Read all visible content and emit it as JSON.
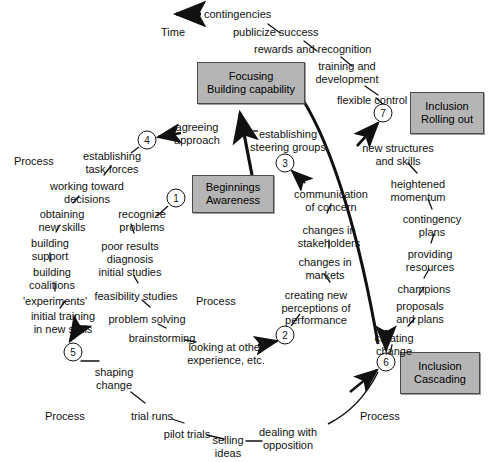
{
  "diagram": {
    "title_axis": {
      "time_label": "Time",
      "time_arrow_icon": "left-arrow-icon"
    },
    "boxes": [
      {
        "id": "focusing",
        "line1": "Focusing",
        "line2": "Building capability",
        "x": 197,
        "y": 62,
        "w": 106,
        "h": 40
      },
      {
        "id": "beginnings",
        "line1": "Beginnings",
        "line2": "Awareness",
        "x": 192,
        "y": 175,
        "w": 80,
        "h": 36
      },
      {
        "id": "rolling",
        "line1": "Inclusion",
        "line2": "Rolling out",
        "x": 410,
        "y": 92,
        "w": 72,
        "h": 40
      },
      {
        "id": "cascading",
        "line1": "Inclusion",
        "line2": "Cascading",
        "x": 400,
        "y": 352,
        "w": 78,
        "h": 40
      }
    ],
    "circles": [
      {
        "n": "1",
        "x": 176,
        "y": 198
      },
      {
        "n": "2",
        "x": 285,
        "y": 335
      },
      {
        "n": "3",
        "x": 285,
        "y": 163
      },
      {
        "n": "4",
        "x": 147,
        "y": 140
      },
      {
        "n": "5",
        "x": 73,
        "y": 352
      },
      {
        "n": "6",
        "x": 386,
        "y": 362
      },
      {
        "n": "7",
        "x": 383,
        "y": 113
      }
    ],
    "process_labels": [
      {
        "text": "Process",
        "x": 14,
        "y": 155
      },
      {
        "text": "Process",
        "x": 196,
        "y": 295
      },
      {
        "text": "Process",
        "x": 45,
        "y": 410
      },
      {
        "text": "Process",
        "x": 360,
        "y": 410
      }
    ],
    "labels": [
      {
        "id": "contingencies",
        "text": "contingencies",
        "x": 204,
        "y": 8,
        "align": "l"
      },
      {
        "id": "time",
        "text": "Time",
        "x": 161,
        "y": 26,
        "align": "l"
      },
      {
        "id": "publicize-success",
        "text": "publicize success",
        "x": 233,
        "y": 26,
        "align": "l"
      },
      {
        "id": "rewards-recognition",
        "text": "rewards and recognition",
        "x": 254,
        "y": 43,
        "align": "l"
      },
      {
        "id": "training-dev",
        "text": "training and\ndevelopment",
        "x": 347,
        "y": 60,
        "align": "c"
      },
      {
        "id": "flexible-control",
        "text": "flexible control",
        "x": 337,
        "y": 94,
        "align": "l"
      },
      {
        "id": "new-structures",
        "text": "new structures\nand skills",
        "x": 398,
        "y": 142,
        "align": "c"
      },
      {
        "id": "heightened-momentum",
        "text": "heightened\nmomentum",
        "x": 418,
        "y": 178,
        "align": "c"
      },
      {
        "id": "contingency-plans",
        "text": "contingency\nplans",
        "x": 432,
        "y": 213,
        "align": "c"
      },
      {
        "id": "providing-resources",
        "text": "providing\nresources",
        "x": 430,
        "y": 248,
        "align": "c"
      },
      {
        "id": "champions",
        "text": "champions",
        "x": 424,
        "y": 283,
        "align": "c"
      },
      {
        "id": "proposals-plans",
        "text": "proposals\nand plans",
        "x": 420,
        "y": 300,
        "align": "c"
      },
      {
        "id": "creating-change",
        "text": "creating\nchange",
        "x": 394,
        "y": 332,
        "align": "c"
      },
      {
        "id": "agreeing-approach",
        "text": "agreeing\napproach",
        "x": 197,
        "y": 121,
        "align": "c"
      },
      {
        "id": "establishing-steering",
        "text": "establishing\nsteering groups",
        "x": 288,
        "y": 128,
        "align": "c"
      },
      {
        "id": "establishing-task",
        "text": "establishing\ntask forces",
        "x": 112,
        "y": 150,
        "align": "c"
      },
      {
        "id": "working-toward",
        "text": "working toward\ndecisions",
        "x": 87,
        "y": 180,
        "align": "c"
      },
      {
        "id": "obtaining-new-skills",
        "text": "obtaining\nnew skills",
        "x": 62,
        "y": 208,
        "align": "c"
      },
      {
        "id": "building-support",
        "text": "building\nsupport",
        "x": 50,
        "y": 237,
        "align": "c"
      },
      {
        "id": "building-coalitions",
        "text": "building\ncoalitions",
        "x": 52,
        "y": 266,
        "align": "c"
      },
      {
        "id": "experiments",
        "text": "'experiments'",
        "x": 55,
        "y": 295,
        "align": "c"
      },
      {
        "id": "initial-training",
        "text": "initial training\nin new skills",
        "x": 63,
        "y": 310,
        "align": "c"
      },
      {
        "id": "recognize-problems",
        "text": "recognize\nproblems",
        "x": 142,
        "y": 208,
        "align": "c"
      },
      {
        "id": "poor-results",
        "text": "poor results",
        "x": 130,
        "y": 240,
        "align": "c"
      },
      {
        "id": "diagnosis",
        "text": "diagnosis",
        "x": 130,
        "y": 253,
        "align": "c"
      },
      {
        "id": "initial-studies",
        "text": "initial studies",
        "x": 130,
        "y": 266,
        "align": "c"
      },
      {
        "id": "feasibility-studies",
        "text": "feasibility studies",
        "x": 136,
        "y": 290,
        "align": "c"
      },
      {
        "id": "problem-solving",
        "text": "problem solving",
        "x": 147,
        "y": 313,
        "align": "c"
      },
      {
        "id": "brainstorming",
        "text": "brainstorming",
        "x": 162,
        "y": 332,
        "align": "c"
      },
      {
        "id": "looking-at-other",
        "text": "looking at other\nexperience, etc.",
        "x": 226,
        "y": 341,
        "align": "c"
      },
      {
        "id": "communication-concern",
        "text": "communication\nof concern",
        "x": 331,
        "y": 188,
        "align": "c"
      },
      {
        "id": "changes-stakeholders",
        "text": "changes in\nstakeholders",
        "x": 329,
        "y": 224,
        "align": "c"
      },
      {
        "id": "changes-markets",
        "text": "changes in\nmarkets",
        "x": 325,
        "y": 256,
        "align": "c"
      },
      {
        "id": "creating-new-perceptions",
        "text": "creating new\nperceptions of\nperformance",
        "x": 316,
        "y": 289,
        "align": "c"
      },
      {
        "id": "shaping-change",
        "text": "shaping\nchange",
        "x": 114,
        "y": 366,
        "align": "c"
      },
      {
        "id": "trial-runs",
        "text": "trial runs",
        "x": 152,
        "y": 410,
        "align": "c"
      },
      {
        "id": "pilot-trials",
        "text": "pilot trials",
        "x": 187,
        "y": 428,
        "align": "c"
      },
      {
        "id": "selling-ideas",
        "text": "selling\nideas",
        "x": 228,
        "y": 434,
        "align": "c"
      },
      {
        "id": "dealing-opposition",
        "text": "dealing with\nopposition",
        "x": 288,
        "y": 426,
        "align": "c"
      }
    ],
    "colors": {
      "box_fill": "#b5b5b5",
      "box_stroke": "#4a4a4a",
      "line": "#111111",
      "background": "#ffffff"
    }
  }
}
